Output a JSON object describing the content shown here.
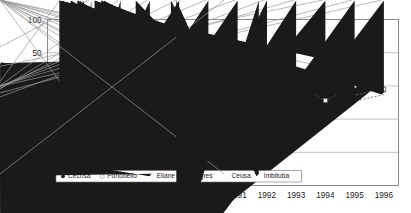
{
  "chart_data": {
    "type": "line",
    "title": "",
    "xlabel": "",
    "ylabel": "%",
    "x": [
      "1985",
      "1986",
      "1987",
      "1988",
      "1989",
      "1990",
      "1991",
      "1992",
      "1993",
      "1994",
      "1995",
      "1996"
    ],
    "categories": [
      "1985",
      "1986",
      "1987",
      "1988",
      "1989",
      "1990",
      "1991",
      "1992",
      "1993",
      "1994",
      "1995",
      "1996"
    ],
    "ylim": [
      -150,
      100
    ],
    "yticks": [
      100,
      50,
      0,
      -50,
      -100,
      -150
    ],
    "yticklabels": [
      "100",
      "50",
      "0",
      "−50",
      "−100",
      "−150"
    ],
    "grid": "horizontal",
    "legend_position": "bottom-left-inside",
    "series": [
      {
        "name": "Cecrisa",
        "marker": "filled-circle",
        "color": "#1a1a1a",
        "values": [
          29,
          31,
          6,
          10,
          -6,
          -3,
          -17,
          -4,
          17,
          -5,
          2,
          -7
        ]
      },
      {
        "name": "Portobello",
        "marker": "open-circle",
        "color": "#8c8c8c",
        "values": [
          53,
          31,
          -35,
          -7,
          3,
          0,
          -3,
          -25,
          0,
          10,
          0,
          -4
        ]
      },
      {
        "name": "Eliane",
        "marker": "filled-triangle",
        "color": "#1a1a1a",
        "values": [
          15,
          34,
          33,
          4,
          -3,
          -2,
          -3,
          -10,
          -32,
          -41,
          20,
          5
        ]
      },
      {
        "name": "Itagres",
        "marker": "open-square",
        "color": "#5a5a5a",
        "values": [
          4,
          31,
          32,
          1,
          -2,
          -2,
          -2,
          -2,
          0,
          -22,
          0,
          -5
        ]
      },
      {
        "name": "Ceusa",
        "marker": "cross",
        "color": "#9a9a9a",
        "values": [
          3,
          55,
          -3,
          -8,
          -7,
          -4,
          -4,
          -20,
          -3,
          26,
          -14,
          -4
        ]
      },
      {
        "name": "Imbituba",
        "marker": "filled-diamond",
        "color": "#1a1a1a",
        "values": [
          3,
          10,
          5,
          9,
          35,
          23,
          13,
          -128,
          -27,
          40,
          -23,
          -13
        ]
      }
    ],
    "extra_points": [
      {
        "series": "Imbituba",
        "x": "1992",
        "value": -75
      }
    ]
  },
  "axis": {
    "ylabel": "%"
  }
}
